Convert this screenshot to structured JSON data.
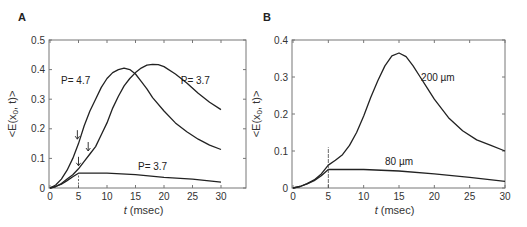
{
  "chart_data": [
    {
      "panel": "A",
      "type": "line",
      "xlabel_italic": "t",
      "xlabel": " (msec)",
      "ylabel": "<E(x0, t)>",
      "xlim": [
        0,
        30
      ],
      "ylim": [
        0,
        0.5
      ],
      "xticks": [
        0,
        5,
        10,
        15,
        20,
        25,
        30
      ],
      "yticks": [
        0,
        0.1,
        0.2,
        0.3,
        0.4,
        0.5
      ],
      "ytick_labels": [
        "0",
        "0.1",
        "0.2",
        "0.3",
        "0.4",
        "0.5"
      ],
      "grid": false,
      "series": [
        {
          "name": "P=4.7",
          "x": [
            0,
            1,
            2,
            3,
            4,
            5,
            6,
            7,
            8,
            9,
            10,
            11,
            12,
            13,
            14,
            15,
            16,
            17,
            18,
            20,
            22,
            24,
            26,
            28,
            30
          ],
          "values": [
            0,
            0.01,
            0.03,
            0.06,
            0.1,
            0.15,
            0.21,
            0.26,
            0.3,
            0.34,
            0.37,
            0.39,
            0.4,
            0.405,
            0.4,
            0.385,
            0.36,
            0.335,
            0.305,
            0.26,
            0.22,
            0.19,
            0.165,
            0.145,
            0.13
          ]
        },
        {
          "name": "P=3.7",
          "x": [
            0,
            1,
            2,
            3,
            4,
            5,
            6,
            7,
            8,
            9,
            10,
            11,
            12,
            13,
            14,
            15,
            16,
            17,
            18,
            19,
            20,
            22,
            24,
            26,
            28,
            30
          ],
          "values": [
            0,
            0.005,
            0.015,
            0.03,
            0.045,
            0.065,
            0.09,
            0.115,
            0.14,
            0.18,
            0.22,
            0.27,
            0.31,
            0.345,
            0.37,
            0.39,
            0.405,
            0.415,
            0.418,
            0.417,
            0.41,
            0.385,
            0.355,
            0.32,
            0.29,
            0.265
          ]
        },
        {
          "name": "P=3.7 (low)",
          "x": [
            0,
            1,
            2,
            3,
            4,
            5,
            6,
            10,
            15,
            20,
            25,
            30
          ],
          "values": [
            0,
            0.005,
            0.013,
            0.025,
            0.038,
            0.05,
            0.05,
            0.05,
            0.045,
            0.036,
            0.03,
            0.02
          ]
        }
      ],
      "annotations": [
        {
          "text": "P= 4.7",
          "x": 4.5,
          "y": 0.35
        },
        {
          "text": "P= 3.7",
          "x": 25.5,
          "y": 0.35
        },
        {
          "text": "P= 3.7",
          "x": 18,
          "y": 0.06
        }
      ],
      "arrows": [
        {
          "x": 4.8,
          "y": 0.165
        },
        {
          "x": 6.7,
          "y": 0.125
        },
        {
          "x": 5.0,
          "y": 0.075
        }
      ],
      "marker_line": {
        "x": 5,
        "y0": 0,
        "y1": 0.05
      }
    },
    {
      "panel": "B",
      "type": "line",
      "xlabel_italic": "t",
      "xlabel": " (msec)",
      "ylabel": "<E(x0, t)>",
      "xlim": [
        0,
        30
      ],
      "ylim": [
        0,
        0.4
      ],
      "xticks": [
        0,
        5,
        10,
        15,
        20,
        25,
        30
      ],
      "yticks": [
        0,
        0.1,
        0.2,
        0.3,
        0.4
      ],
      "ytick_labels": [
        "0",
        "0.1",
        "0.2",
        "0.3",
        "0.4"
      ],
      "grid": false,
      "series": [
        {
          "name": "200 µm",
          "x": [
            0,
            1,
            2,
            3,
            4,
            5,
            6,
            7,
            8,
            9,
            10,
            11,
            12,
            13,
            14,
            15,
            16,
            17,
            18,
            19,
            20,
            22,
            24,
            26,
            28,
            30
          ],
          "values": [
            0,
            0.004,
            0.012,
            0.022,
            0.038,
            0.062,
            0.075,
            0.09,
            0.115,
            0.15,
            0.195,
            0.245,
            0.29,
            0.33,
            0.357,
            0.365,
            0.355,
            0.33,
            0.3,
            0.27,
            0.24,
            0.19,
            0.155,
            0.13,
            0.115,
            0.1
          ]
        },
        {
          "name": "80 µm",
          "x": [
            0,
            1,
            2,
            3,
            4,
            5,
            6,
            10,
            15,
            20,
            25,
            30
          ],
          "values": [
            0,
            0.004,
            0.011,
            0.02,
            0.033,
            0.05,
            0.05,
            0.05,
            0.046,
            0.038,
            0.029,
            0.018
          ]
        }
      ],
      "annotations": [
        {
          "text": "200 µm",
          "x": 20.5,
          "y": 0.29
        },
        {
          "text": "80 µm",
          "x": 15,
          "y": 0.063
        }
      ],
      "marker_line": {
        "x": 5,
        "y0": 0,
        "y1": 0.11
      }
    }
  ]
}
